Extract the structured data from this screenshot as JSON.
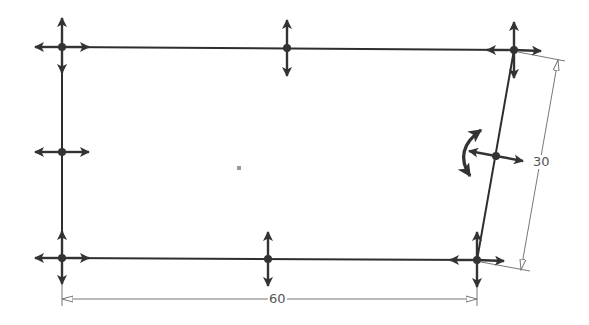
{
  "sketch": {
    "shape": "parallelogram-rectangle",
    "colors": {
      "edge": "#2e2e2e",
      "handle": "#333333",
      "dimension": "#777777",
      "dimension_text": "#555555",
      "center": "#999999"
    },
    "vertices": [
      {
        "id": "top-left",
        "x": 62,
        "y": 47
      },
      {
        "id": "top-right",
        "x": 514,
        "y": 50
      },
      {
        "id": "bottom-right",
        "x": 477,
        "y": 260
      },
      {
        "id": "bottom-left",
        "x": 62,
        "y": 258
      }
    ],
    "edge_midpoints": [
      {
        "id": "top",
        "x": 287,
        "y": 48
      },
      {
        "id": "left",
        "x": 62,
        "y": 152
      },
      {
        "id": "bottom",
        "x": 268,
        "y": 259
      },
      {
        "id": "right",
        "x": 496,
        "y": 156
      }
    ],
    "center_point": {
      "x": 239,
      "y": 168
    },
    "rotate_handle": {
      "x": 466,
      "y": 153
    }
  },
  "dimensions": {
    "width": {
      "value": "60",
      "label_x": 268,
      "label_y": 292
    },
    "height": {
      "value": "30",
      "label_x": 532,
      "label_y": 155
    }
  }
}
